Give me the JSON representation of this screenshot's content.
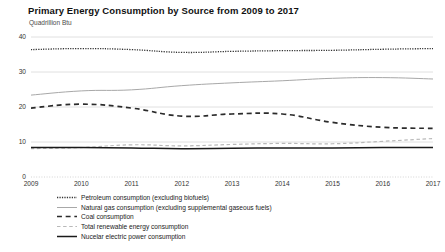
{
  "chart_data": {
    "type": "line",
    "title": "Primary Energy Consumption by Source from 2009 to 2017",
    "subtitle": "Quadrillion Btu",
    "xlabel": "",
    "ylabel": "Quadrillion Btu",
    "x": [
      2009,
      2010,
      2011,
      2012,
      2013,
      2014,
      2015,
      2016,
      2017
    ],
    "xticklabels": [
      "2009",
      "2010",
      "2011",
      "2012",
      "2013",
      "2014",
      "2015",
      "2016",
      "2017"
    ],
    "yticks": [
      0,
      10,
      20,
      30,
      40
    ],
    "yticklabels": [
      "0",
      "10",
      "20",
      "30",
      "40"
    ],
    "ylim": [
      0,
      40
    ],
    "xlim": [
      2009,
      2017
    ],
    "grid": true,
    "legend_position": "below",
    "series": [
      {
        "name": "Petroleum consumption (excluding biofuels)",
        "style": "dotted",
        "color": "#333333",
        "width": 1.3,
        "values": [
          36.4,
          36.7,
          36.4,
          35.6,
          35.9,
          36.1,
          36.2,
          36.5,
          36.7
        ]
      },
      {
        "name": "Natural gas consumption (excluding supplemental gaseous fuels)",
        "style": "solid",
        "color": "#a8a8a8",
        "width": 1.0,
        "values": [
          23.4,
          24.6,
          24.9,
          26.1,
          26.9,
          27.5,
          28.2,
          28.4,
          28.0
        ]
      },
      {
        "name": "Coal consumption",
        "style": "dashed",
        "color": "#2b2b2b",
        "width": 1.7,
        "values": [
          19.7,
          20.8,
          19.7,
          17.4,
          18.0,
          18.0,
          15.6,
          14.2,
          13.9
        ]
      },
      {
        "name": "Total renewable energy consumption",
        "style": "dashed",
        "color": "#b9b9b9",
        "width": 1.2,
        "values": [
          8.1,
          8.4,
          9.2,
          8.9,
          9.3,
          9.6,
          9.5,
          10.2,
          11.0
        ]
      },
      {
        "name": "Nucelar electric power consumption",
        "style": "solid",
        "color": "#1a1a1a",
        "width": 1.5,
        "values": [
          8.4,
          8.4,
          8.3,
          8.1,
          8.2,
          8.3,
          8.3,
          8.4,
          8.4
        ]
      }
    ]
  },
  "legend": {
    "items": [
      {
        "label": "Petroleum consumption (excluding biofuels)",
        "key": "dotted-line-key"
      },
      {
        "label": "Natural gas consumption (excluding supplemental gaseous fuels)",
        "key": "solid-gray-line-key"
      },
      {
        "label": "Coal consumption",
        "key": "dashed-dark-line-key"
      },
      {
        "label": "Total renewable energy consumption",
        "key": "dashed-gray-line-key"
      },
      {
        "label": "Nucelar electric power consumption",
        "key": "solid-black-line-key"
      }
    ]
  }
}
